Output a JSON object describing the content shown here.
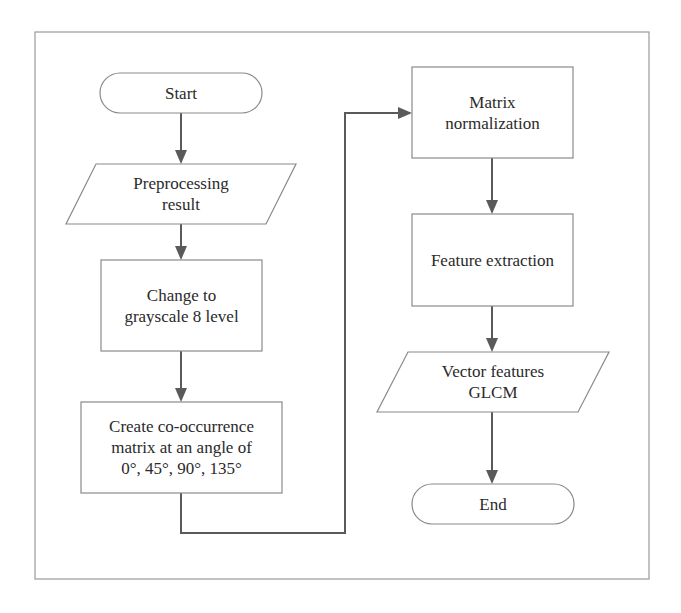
{
  "diagram": {
    "type": "flowchart",
    "colors": {
      "background": "#ffffff",
      "frame_stroke": "#9a9a9a",
      "shape_stroke": "#8a8a8a",
      "shape_fill": "#ffffff",
      "connector": "#5a5a5a",
      "text": "#2a2a2a"
    },
    "frame": {
      "x": 35,
      "y": 32,
      "w": 614,
      "h": 547
    },
    "nodes": [
      {
        "id": "start",
        "shape": "terminal",
        "label": "Start",
        "x": 100,
        "y": 73,
        "w": 162,
        "h": 40
      },
      {
        "id": "preprocessing",
        "shape": "parallelogram",
        "label": "Preprocessing\nresult",
        "x": 66,
        "y": 164,
        "w": 230,
        "h": 60,
        "skew": 30
      },
      {
        "id": "grayscale",
        "shape": "rect",
        "label": "Change to\ngrayscale 8 level",
        "x": 101,
        "y": 260,
        "w": 161,
        "h": 91
      },
      {
        "id": "cooccurrence",
        "shape": "rect",
        "label": "Create co-occurrence\nmatrix at an angle of\n0°, 45°, 90°, 135°",
        "x": 81,
        "y": 402,
        "w": 201,
        "h": 91
      },
      {
        "id": "normalization",
        "shape": "rect",
        "label": "Matrix\nnormalization",
        "x": 412,
        "y": 67,
        "w": 161,
        "h": 91
      },
      {
        "id": "extraction",
        "shape": "rect",
        "label": "Feature extraction",
        "x": 412,
        "y": 214,
        "w": 161,
        "h": 92
      },
      {
        "id": "vector",
        "shape": "parallelogram",
        "label": "Vector features\nGLCM",
        "x": 377,
        "y": 352,
        "w": 232,
        "h": 60,
        "skew": 31
      },
      {
        "id": "end",
        "shape": "terminal",
        "label": "End",
        "x": 412,
        "y": 484,
        "w": 162,
        "h": 40
      }
    ],
    "edges": [
      {
        "from": "start",
        "to": "preprocessing",
        "points": [
          [
            181,
            113
          ],
          [
            181,
            164
          ]
        ]
      },
      {
        "from": "preprocessing",
        "to": "grayscale",
        "points": [
          [
            181,
            224
          ],
          [
            181,
            260
          ]
        ]
      },
      {
        "from": "grayscale",
        "to": "cooccurrence",
        "points": [
          [
            181,
            351
          ],
          [
            181,
            402
          ]
        ]
      },
      {
        "from": "cooccurrence",
        "to": "normalization",
        "points": [
          [
            181,
            493
          ],
          [
            181,
            533
          ],
          [
            345,
            533
          ],
          [
            345,
            113
          ],
          [
            412,
            113
          ]
        ]
      },
      {
        "from": "normalization",
        "to": "extraction",
        "points": [
          [
            492,
            158
          ],
          [
            492,
            214
          ]
        ]
      },
      {
        "from": "extraction",
        "to": "vector",
        "points": [
          [
            492,
            306
          ],
          [
            492,
            352
          ]
        ]
      },
      {
        "from": "vector",
        "to": "end",
        "points": [
          [
            492,
            412
          ],
          [
            492,
            484
          ]
        ]
      }
    ]
  }
}
